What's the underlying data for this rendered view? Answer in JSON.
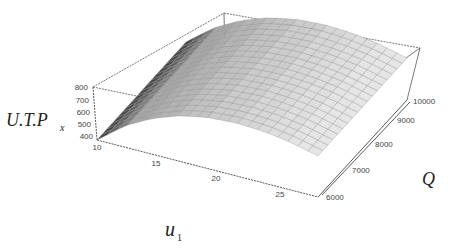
{
  "chart_data": {
    "type": "surface3d",
    "title": "",
    "xlabel": "u1",
    "xlabel_main": "u",
    "xlabel_sub": "1",
    "ylabel": "Q",
    "zlabel": "U.T.P_x",
    "zlabel_main": "U.T.P",
    "zlabel_sub": "x",
    "x_ticks": [
      "10",
      "15",
      "20",
      "25"
    ],
    "y_ticks": [
      "6000",
      "7000",
      "8000",
      "9000",
      "10000"
    ],
    "z_ticks": [
      "400",
      "500",
      "600",
      "700",
      "800"
    ],
    "xlim": [
      10,
      26
    ],
    "ylim": [
      6000,
      10000
    ],
    "zlim": [
      400,
      800
    ],
    "surface_description": "Concave-down ridge in u1: rises from ~400 at u1=10, peaks (~800) near u1=20-22, falls toward u1=25; nearly flat along Q",
    "samples": {
      "u1": [
        10,
        12,
        14,
        16,
        18,
        20,
        22,
        24,
        26
      ],
      "Q": [
        6000,
        7000,
        8000,
        9000,
        10000
      ],
      "z_profile_over_u1": [
        400,
        560,
        670,
        745,
        785,
        800,
        790,
        760,
        710
      ]
    },
    "box": true,
    "grid": false,
    "legend": null
  }
}
